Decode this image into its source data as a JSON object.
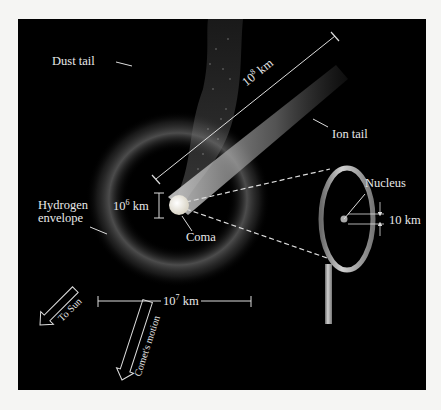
{
  "labels": {
    "dust_tail": "Dust tail",
    "ion_tail": "Ion tail",
    "ion_tail_length_base": "10",
    "ion_tail_length_exp": "8",
    "ion_tail_length_unit": " km",
    "hydrogen_line1": "Hydrogen",
    "hydrogen_line2": "envelope",
    "coma_size_base": "10",
    "coma_size_exp": "6",
    "coma_size_unit": " km",
    "coma": "Coma",
    "nucleus": "Nucleus",
    "nucleus_size": "10 km",
    "envelope_size_base": "10",
    "envelope_size_exp": "7",
    "envelope_size_unit": " km",
    "to_sun": "To Sun",
    "comet_motion": "Comet's motion"
  },
  "colors": {
    "background": "#000000",
    "page": "#f5f5f3",
    "text": "#e8e8e8",
    "coma": "#f4f1e6",
    "ion_tail": "#9a9a9a",
    "magnifier_rim": "#a8a8a8"
  }
}
